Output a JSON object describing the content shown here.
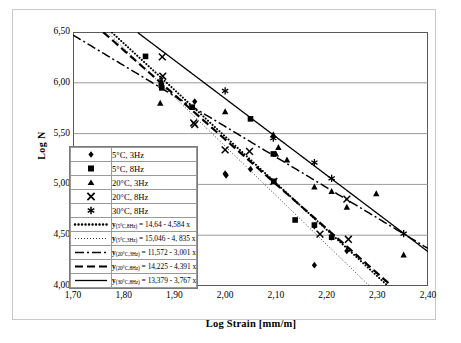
{
  "chart_data": {
    "type": "scatter",
    "title": "",
    "xlabel": "Log Strain [mm/m]",
    "ylabel": "Log N",
    "xlim": [
      1.7,
      2.4
    ],
    "ylim": [
      4.0,
      6.5
    ],
    "xticks": [
      "1,70",
      "1,80",
      "1,90",
      "2,00",
      "2,10",
      "2,20",
      "2,30",
      "2,40"
    ],
    "yticks": [
      "6,50",
      "6,00",
      "5,50",
      "5,00",
      "4,50",
      "4,00"
    ],
    "xtick_values": [
      1.7,
      1.8,
      1.9,
      2.0,
      2.1,
      2.2,
      2.3,
      2.4
    ],
    "ytick_values": [
      6.5,
      6.0,
      5.5,
      5.0,
      4.5,
      4.0
    ],
    "grid": "horizontal",
    "legend_position": "inner-left",
    "series": [
      {
        "name": "5°C, 3Hz",
        "marker": "diamond",
        "points": [
          [
            1.874,
            6.01
          ],
          [
            1.94,
            5.815
          ],
          [
            2.0,
            5.105
          ],
          [
            2.002,
            5.09
          ],
          [
            2.05,
            5.15
          ],
          [
            2.176,
            4.59
          ],
          [
            2.176,
            4.205
          ],
          [
            2.21,
            4.48
          ],
          [
            2.24,
            4.345
          ]
        ]
      },
      {
        "name": "5°C, 8Hz",
        "marker": "square",
        "points": [
          [
            1.843,
            6.26
          ],
          [
            1.874,
            5.975
          ],
          [
            1.875,
            5.95
          ],
          [
            1.935,
            5.76
          ],
          [
            2.05,
            5.645
          ],
          [
            2.095,
            5.3
          ],
          [
            2.096,
            5.03
          ],
          [
            2.138,
            4.65
          ],
          [
            2.176,
            4.6
          ],
          [
            2.21,
            4.48
          ]
        ]
      },
      {
        "name": "20°C, 3Hz",
        "marker": "triangle",
        "points": [
          [
            1.872,
            5.8
          ],
          [
            2.0,
            5.715
          ],
          [
            2.095,
            5.49
          ],
          [
            2.105,
            5.365
          ],
          [
            2.1,
            5.3
          ],
          [
            2.122,
            5.24
          ],
          [
            2.176,
            4.975
          ],
          [
            2.21,
            4.93
          ],
          [
            2.24,
            4.775
          ],
          [
            2.298,
            4.91
          ],
          [
            2.352,
            4.305
          ]
        ]
      },
      {
        "name": "20°C, 8Hz",
        "marker": "x",
        "points": [
          [
            1.876,
            6.255
          ],
          [
            1.877,
            6.065
          ],
          [
            1.938,
            5.605
          ],
          [
            1.94,
            5.59
          ],
          [
            2.0,
            5.34
          ],
          [
            2.048,
            5.325
          ],
          [
            2.096,
            5.03
          ],
          [
            2.187,
            4.51
          ],
          [
            2.24,
            4.855
          ],
          [
            2.243,
            4.46
          ]
        ]
      },
      {
        "name": "30°C, 8Hz",
        "marker": "asterisk",
        "points": [
          [
            2.0,
            5.92
          ],
          [
            2.095,
            5.455
          ],
          [
            2.176,
            5.215
          ],
          [
            2.21,
            5.06
          ],
          [
            2.352,
            4.515
          ]
        ]
      }
    ],
    "fits": [
      {
        "label_prefix": "y",
        "label_sub": "(5°C,8Hz)",
        "equation": "= 14,64 - 4,584 x",
        "full_text": "y(5°C,8Hz) = 14,64 - 4,584 x",
        "intercept": 14.64,
        "slope": -4.584,
        "style": "thick-dotted"
      },
      {
        "label_prefix": "y",
        "label_sub": "(5°C,3Hz)",
        "equation": "= 15,046 - 4, 835 x",
        "full_text": "y(5°C,3Hz) = 15,046 - 4, 835 x",
        "intercept": 15.046,
        "slope": -4.835,
        "style": "fine-dotted"
      },
      {
        "label_prefix": "y",
        "label_sub": "(20°C,3Hz)",
        "equation": "= 11,572 - 3,001 x",
        "full_text": "y(20°C,3Hz) = 11,572 - 3,001 x",
        "intercept": 11.572,
        "slope": -3.001,
        "style": "dash-dot"
      },
      {
        "label_prefix": "y",
        "label_sub": "(20°C,8Hz)",
        "equation": "= 14,225 - 4,391 x",
        "full_text": "y(20°C,8Hz) = 14,225 - 4,391 x",
        "intercept": 14.225,
        "slope": -4.391,
        "style": "dashed"
      },
      {
        "label_prefix": "y",
        "label_sub": "(30°C,8Hz)",
        "equation": "= 13,379 - 3,767 x",
        "full_text": "y(30°C,8Hz) = 13,379 - 3,767 x",
        "intercept": 13.379,
        "slope": -3.767,
        "style": "solid"
      }
    ]
  },
  "colors": {
    "ink": "#000000",
    "grid": "#808080",
    "axis": "#595959",
    "frame": "#c9c9c9",
    "legend_border": "#7a7a7a",
    "background": "#ffffff"
  }
}
